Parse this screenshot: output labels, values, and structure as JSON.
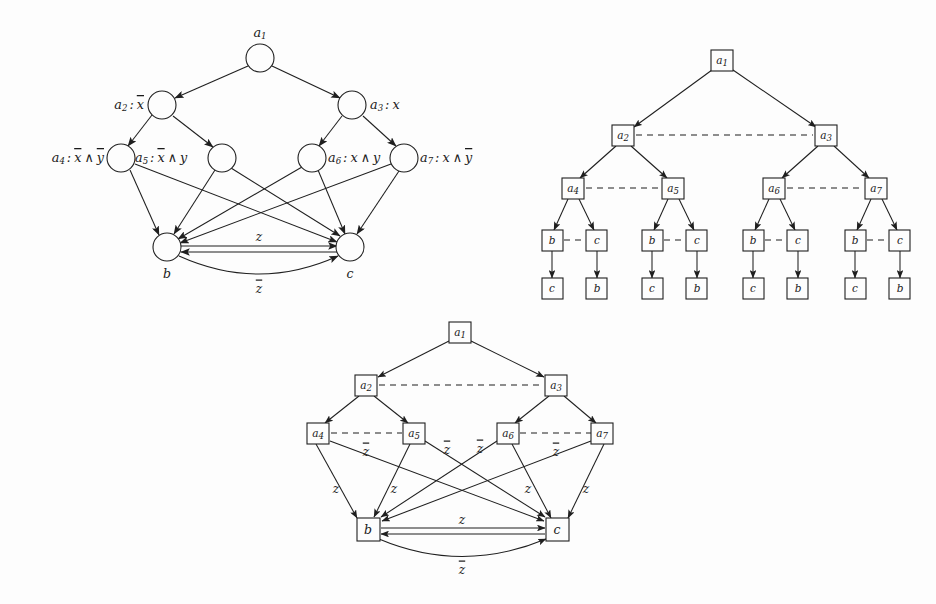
{
  "figure": {
    "background_color": "#fdfdfd",
    "ink_color": "#1f1f1f",
    "panel_count": 3
  },
  "symbols": {
    "a1": "a₁",
    "a2": "a₂",
    "a3": "a₃",
    "a4": "a₄",
    "a5": "a₅",
    "a6": "a₆",
    "a7": "a₇",
    "b": "b",
    "c": "c",
    "z": "z",
    "z_bar": "z̄",
    "x": "x",
    "x_bar": "x̄",
    "y": "y",
    "y_bar": "ȳ"
  },
  "panel_top_left": {
    "name": "circle-node-graph",
    "node_shape": "circle",
    "nodes": [
      {
        "id": "a1",
        "label": "a₁",
        "label_position": "above",
        "outer_label": "",
        "x": 260,
        "y": 58,
        "r": 14
      },
      {
        "id": "a2",
        "label": "",
        "label_position": "left",
        "outer_label": "a₂ : x̄",
        "x": 162,
        "y": 105,
        "r": 14
      },
      {
        "id": "a3",
        "label": "",
        "label_position": "right",
        "outer_label": "a₃ : x",
        "x": 352,
        "y": 105,
        "r": 14
      },
      {
        "id": "a4",
        "label": "",
        "label_position": "left",
        "outer_label": "a₄ : x̄ ∧ ȳ",
        "x": 121,
        "y": 158,
        "r": 14
      },
      {
        "id": "a5",
        "label": "",
        "label_position": "left",
        "outer_label": "a₅ : x̄ ∧ y",
        "x": 222,
        "y": 158,
        "r": 14
      },
      {
        "id": "a6",
        "label": "",
        "label_position": "left",
        "outer_label": "a₆ : x ∧ y",
        "x": 312,
        "y": 158,
        "r": 14
      },
      {
        "id": "a7",
        "label": "",
        "label_position": "right",
        "outer_label": "a₇ : x ∧ ȳ",
        "x": 404,
        "y": 158,
        "r": 14
      },
      {
        "id": "b",
        "label": "b",
        "label_position": "below",
        "outer_label": "",
        "x": 167,
        "y": 247,
        "r": 14
      },
      {
        "id": "c",
        "label": "c",
        "label_position": "below",
        "outer_label": "",
        "x": 350,
        "y": 247,
        "r": 14
      }
    ],
    "edges": [
      {
        "from": "a1",
        "to": "a2",
        "style": "solid",
        "arrow": true,
        "label": ""
      },
      {
        "from": "a1",
        "to": "a3",
        "style": "solid",
        "arrow": true,
        "label": ""
      },
      {
        "from": "a2",
        "to": "a4",
        "style": "solid",
        "arrow": true,
        "label": ""
      },
      {
        "from": "a2",
        "to": "a5",
        "style": "solid",
        "arrow": true,
        "label": ""
      },
      {
        "from": "a3",
        "to": "a6",
        "style": "solid",
        "arrow": true,
        "label": ""
      },
      {
        "from": "a3",
        "to": "a7",
        "style": "solid",
        "arrow": true,
        "label": ""
      },
      {
        "from": "a4",
        "to": "b",
        "style": "solid",
        "arrow": true,
        "label": ""
      },
      {
        "from": "a4",
        "to": "c",
        "style": "solid",
        "arrow": true,
        "label": ""
      },
      {
        "from": "a5",
        "to": "b",
        "style": "solid",
        "arrow": true,
        "label": ""
      },
      {
        "from": "a5",
        "to": "c",
        "style": "solid",
        "arrow": true,
        "label": ""
      },
      {
        "from": "a6",
        "to": "b",
        "style": "solid",
        "arrow": true,
        "label": ""
      },
      {
        "from": "a6",
        "to": "c",
        "style": "solid",
        "arrow": true,
        "label": ""
      },
      {
        "from": "a7",
        "to": "b",
        "style": "solid",
        "arrow": true,
        "label": ""
      },
      {
        "from": "a7",
        "to": "c",
        "style": "solid",
        "arrow": true,
        "label": ""
      },
      {
        "from": "b",
        "to": "c",
        "style": "solid",
        "arrow": true,
        "label": "z",
        "label_position": "above"
      },
      {
        "from": "c",
        "to": "b",
        "style": "solid",
        "arrow": true,
        "label": "",
        "label_position": "none"
      },
      {
        "from": "b",
        "to": "c",
        "style": "arc",
        "arrow": true,
        "label": "z̄",
        "label_position": "below"
      }
    ],
    "edge_labels": [
      {
        "text": "z",
        "x": 259,
        "y": 237
      },
      {
        "text": "z̄",
        "x": 259,
        "y": 287
      }
    ]
  },
  "panel_top_right": {
    "name": "box-tree-graph",
    "node_shape": "box",
    "nodes": [
      {
        "id": "a1",
        "label": "a₁",
        "x": 722,
        "y": 61
      },
      {
        "id": "a2",
        "label": "a₂",
        "x": 623,
        "y": 135
      },
      {
        "id": "a3",
        "label": "a₃",
        "x": 826,
        "y": 135
      },
      {
        "id": "a4",
        "label": "a₄",
        "x": 573,
        "y": 188
      },
      {
        "id": "a5",
        "label": "a₅",
        "x": 673,
        "y": 188
      },
      {
        "id": "a6",
        "label": "a₆",
        "x": 774,
        "y": 188
      },
      {
        "id": "a7",
        "label": "a₇",
        "x": 876,
        "y": 188
      },
      {
        "id": "b1",
        "label": "b",
        "x": 552,
        "y": 240
      },
      {
        "id": "c1",
        "label": "c",
        "x": 597,
        "y": 240
      },
      {
        "id": "b2",
        "label": "b",
        "x": 652,
        "y": 240
      },
      {
        "id": "c2",
        "label": "c",
        "x": 697,
        "y": 240
      },
      {
        "id": "b3",
        "label": "b",
        "x": 753,
        "y": 240
      },
      {
        "id": "c3",
        "label": "c",
        "x": 798,
        "y": 240
      },
      {
        "id": "b4",
        "label": "b",
        "x": 855,
        "y": 240
      },
      {
        "id": "c4",
        "label": "c",
        "x": 900,
        "y": 240
      },
      {
        "id": "c1d",
        "label": "c",
        "x": 552,
        "y": 288
      },
      {
        "id": "b1d",
        "label": "b",
        "x": 597,
        "y": 288
      },
      {
        "id": "c2d",
        "label": "c",
        "x": 652,
        "y": 288
      },
      {
        "id": "b2d",
        "label": "b",
        "x": 697,
        "y": 288
      },
      {
        "id": "c3d",
        "label": "c",
        "x": 753,
        "y": 288
      },
      {
        "id": "b3d",
        "label": "b",
        "x": 798,
        "y": 288
      },
      {
        "id": "c4d",
        "label": "c",
        "x": 855,
        "y": 288
      },
      {
        "id": "b4d",
        "label": "b",
        "x": 900,
        "y": 288
      }
    ],
    "edges": [
      {
        "from": "a1",
        "to": "a2",
        "style": "solid",
        "arrow": true
      },
      {
        "from": "a1",
        "to": "a3",
        "style": "solid",
        "arrow": true
      },
      {
        "from": "a2",
        "to": "a3",
        "style": "dashed",
        "arrow": false
      },
      {
        "from": "a2",
        "to": "a4",
        "style": "solid",
        "arrow": true
      },
      {
        "from": "a2",
        "to": "a5",
        "style": "solid",
        "arrow": true
      },
      {
        "from": "a3",
        "to": "a6",
        "style": "solid",
        "arrow": true
      },
      {
        "from": "a3",
        "to": "a7",
        "style": "solid",
        "arrow": true
      },
      {
        "from": "a4",
        "to": "a5",
        "style": "dashed",
        "arrow": false
      },
      {
        "from": "a6",
        "to": "a7",
        "style": "dashed",
        "arrow": false
      },
      {
        "from": "a4",
        "to": "b1",
        "style": "solid",
        "arrow": true
      },
      {
        "from": "a4",
        "to": "c1",
        "style": "solid",
        "arrow": true
      },
      {
        "from": "a5",
        "to": "b2",
        "style": "solid",
        "arrow": true
      },
      {
        "from": "a5",
        "to": "c2",
        "style": "solid",
        "arrow": true
      },
      {
        "from": "a6",
        "to": "b3",
        "style": "solid",
        "arrow": true
      },
      {
        "from": "a6",
        "to": "c3",
        "style": "solid",
        "arrow": true
      },
      {
        "from": "a7",
        "to": "b4",
        "style": "solid",
        "arrow": true
      },
      {
        "from": "a7",
        "to": "c4",
        "style": "solid",
        "arrow": true
      },
      {
        "from": "b1",
        "to": "c1",
        "style": "dashed",
        "arrow": false
      },
      {
        "from": "b2",
        "to": "c2",
        "style": "dashed",
        "arrow": false
      },
      {
        "from": "b3",
        "to": "c3",
        "style": "dashed",
        "arrow": false
      },
      {
        "from": "b4",
        "to": "c4",
        "style": "dashed",
        "arrow": false
      },
      {
        "from": "b1",
        "to": "c1d",
        "style": "solid",
        "arrow": true
      },
      {
        "from": "c1",
        "to": "b1d",
        "style": "solid",
        "arrow": true
      },
      {
        "from": "b2",
        "to": "c2d",
        "style": "solid",
        "arrow": true
      },
      {
        "from": "c2",
        "to": "b2d",
        "style": "solid",
        "arrow": true
      },
      {
        "from": "b3",
        "to": "c3d",
        "style": "solid",
        "arrow": true
      },
      {
        "from": "c3",
        "to": "b3d",
        "style": "solid",
        "arrow": true
      },
      {
        "from": "b4",
        "to": "c4d",
        "style": "solid",
        "arrow": true
      },
      {
        "from": "c4",
        "to": "b4d",
        "style": "solid",
        "arrow": true
      }
    ]
  },
  "panel_bottom": {
    "name": "box-node-graph-labeled",
    "node_shape": "box",
    "nodes": [
      {
        "id": "a1",
        "label": "a₁",
        "x": 460,
        "y": 332
      },
      {
        "id": "a2",
        "label": "a₂",
        "x": 366,
        "y": 385
      },
      {
        "id": "a3",
        "label": "a₃",
        "x": 556,
        "y": 385
      },
      {
        "id": "a4",
        "label": "a₄",
        "x": 318,
        "y": 433
      },
      {
        "id": "a5",
        "label": "a₅",
        "x": 414,
        "y": 433
      },
      {
        "id": "a6",
        "label": "a₆",
        "x": 508,
        "y": 433
      },
      {
        "id": "a7",
        "label": "a₇",
        "x": 602,
        "y": 433
      },
      {
        "id": "b",
        "label": "b",
        "x": 368,
        "y": 529
      },
      {
        "id": "c",
        "label": "c",
        "x": 557,
        "y": 529
      }
    ],
    "edges": [
      {
        "from": "a1",
        "to": "a2",
        "style": "solid",
        "arrow": true,
        "label": ""
      },
      {
        "from": "a1",
        "to": "a3",
        "style": "solid",
        "arrow": true,
        "label": ""
      },
      {
        "from": "a2",
        "to": "a3",
        "style": "dashed",
        "arrow": false,
        "label": ""
      },
      {
        "from": "a2",
        "to": "a4",
        "style": "solid",
        "arrow": true,
        "label": ""
      },
      {
        "from": "a2",
        "to": "a5",
        "style": "solid",
        "arrow": true,
        "label": ""
      },
      {
        "from": "a3",
        "to": "a6",
        "style": "solid",
        "arrow": true,
        "label": ""
      },
      {
        "from": "a3",
        "to": "a7",
        "style": "solid",
        "arrow": true,
        "label": ""
      },
      {
        "from": "a4",
        "to": "a5",
        "style": "dashed",
        "arrow": false,
        "label": "z̄"
      },
      {
        "from": "a6",
        "to": "a7",
        "style": "dashed",
        "arrow": false,
        "label": "z̄"
      },
      {
        "from": "a4",
        "to": "b",
        "style": "solid",
        "arrow": true,
        "label": "z"
      },
      {
        "from": "a5",
        "to": "b",
        "style": "solid",
        "arrow": true,
        "label": "z"
      },
      {
        "from": "a6",
        "to": "c",
        "style": "solid",
        "arrow": true,
        "label": "z"
      },
      {
        "from": "a7",
        "to": "c",
        "style": "solid",
        "arrow": true,
        "label": "z"
      },
      {
        "from": "a4",
        "to": "c",
        "style": "solid",
        "arrow": true,
        "label": ""
      },
      {
        "from": "a5",
        "to": "c",
        "style": "solid",
        "arrow": true,
        "label": "z̄"
      },
      {
        "from": "a6",
        "to": "b",
        "style": "solid",
        "arrow": true,
        "label": "z̄"
      },
      {
        "from": "a7",
        "to": "b",
        "style": "solid",
        "arrow": true,
        "label": ""
      },
      {
        "from": "b",
        "to": "c",
        "style": "solid",
        "arrow": true,
        "label": "z"
      },
      {
        "from": "c",
        "to": "b",
        "style": "solid",
        "arrow": true,
        "label": ""
      },
      {
        "from": "b",
        "to": "c",
        "style": "arc",
        "arrow": true,
        "label": "z̄"
      }
    ],
    "edge_labels": [
      {
        "text": "z̄",
        "x": 366,
        "y": 451
      },
      {
        "text": "z̄",
        "x": 447,
        "y": 449
      },
      {
        "text": "z̄",
        "x": 479,
        "y": 448
      },
      {
        "text": "z̄",
        "x": 556,
        "y": 451
      },
      {
        "text": "z",
        "x": 336,
        "y": 488
      },
      {
        "text": "z",
        "x": 394,
        "y": 488
      },
      {
        "text": "z",
        "x": 527,
        "y": 488
      },
      {
        "text": "z",
        "x": 586,
        "y": 488
      },
      {
        "text": "z",
        "x": 462,
        "y": 520
      },
      {
        "text": "z̄",
        "x": 462,
        "y": 568
      }
    ]
  }
}
